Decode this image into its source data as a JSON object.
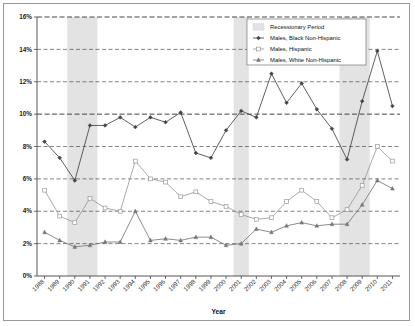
{
  "chart_data": {
    "type": "line",
    "title": "",
    "xlabel": "Year",
    "ylabel": "",
    "ylim": [
      0,
      16
    ],
    "ytick_labels": [
      "0%",
      "2%",
      "4%",
      "6%",
      "8%",
      "10%",
      "12%",
      "14%",
      "16%"
    ],
    "ytick_values": [
      0,
      2,
      4,
      6,
      8,
      10,
      12,
      14,
      16
    ],
    "grid": true,
    "legend_position": "top-right",
    "categories": [
      "1988",
      "1989",
      "1990",
      "1991",
      "1992",
      "1993",
      "1994",
      "1995",
      "1996",
      "1997",
      "1998",
      "1999",
      "2000",
      "2001",
      "2002",
      "2003",
      "2004",
      "2005",
      "2006",
      "2007",
      "2008",
      "2009",
      "2010",
      "2011"
    ],
    "series": [
      {
        "name": "Males, Black Non-Hispanic",
        "marker": "diamond",
        "color": "#444444",
        "values": [
          8.3,
          7.3,
          5.9,
          9.3,
          9.3,
          9.8,
          9.2,
          9.8,
          9.5,
          10.1,
          7.6,
          7.3,
          9.0,
          10.2,
          9.8,
          12.5,
          10.7,
          11.9,
          10.3,
          9.1,
          7.2,
          10.8,
          13.9,
          10.5
        ]
      },
      {
        "name": "Males, Hispanic",
        "marker": "square",
        "color": "#9a9a9a",
        "values": [
          5.3,
          3.7,
          3.3,
          4.8,
          4.2,
          4.0,
          7.1,
          6.0,
          5.8,
          4.9,
          5.2,
          4.6,
          4.3,
          3.8,
          3.5,
          3.6,
          4.6,
          5.3,
          4.6,
          3.6,
          4.1,
          5.6,
          8.0,
          7.1
        ]
      },
      {
        "name": "Males, White Non-Hispanic",
        "marker": "triangle",
        "color": "#777777",
        "values": [
          2.7,
          2.2,
          1.8,
          1.9,
          2.1,
          2.1,
          4.0,
          2.2,
          2.3,
          2.2,
          2.4,
          2.4,
          1.9,
          2.0,
          2.9,
          2.7,
          3.1,
          3.3,
          3.1,
          3.2,
          3.2,
          4.4,
          5.9,
          5.4
        ]
      }
    ],
    "shaded_regions": [
      {
        "label": "Recessionary Period",
        "start": "1990",
        "end": "1991"
      },
      {
        "label": "Recessionary Period",
        "start": "2001",
        "end": "2001"
      },
      {
        "label": "Recessionary Period",
        "start": "2008",
        "end": "2009"
      }
    ],
    "shaded_color": "#e3e3e3"
  },
  "legend": {
    "entries": [
      {
        "label": "Recessionary Period",
        "swatch": "band"
      },
      {
        "label": "Males, Black Non-Hispanic",
        "swatch": "diamond"
      },
      {
        "label": "Males, Hispanic",
        "swatch": "square"
      },
      {
        "label": "Males, White Non-Hispanic",
        "swatch": "triangle"
      }
    ]
  },
  "axes": {
    "x_title": "Year"
  }
}
